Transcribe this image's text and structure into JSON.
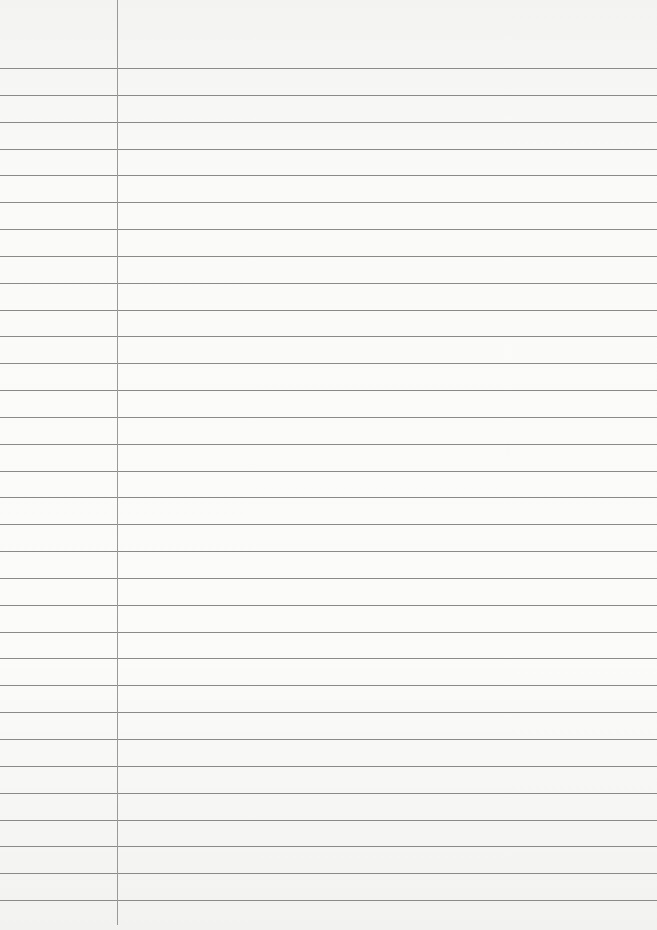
{
  "paper": {
    "type": "ruled-lined-sheet",
    "background_color": "#f9f9f8",
    "line_color": "#8a8a8a",
    "margin_line_color": "#9a9a9a",
    "margin_x": 117,
    "first_line_y": 68,
    "line_spacing": 26.84,
    "line_count": 32
  }
}
